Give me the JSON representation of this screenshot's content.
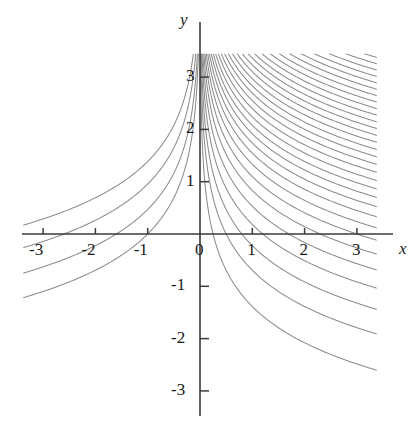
{
  "figure": {
    "type": "contour-plot",
    "background_color": "#ffffff",
    "axis_color": "#3a3a3a",
    "contour_color": "#8c8c8c",
    "text_color": "#1a1a1a"
  },
  "axes": {
    "x_label": "x",
    "y_label": "y",
    "x_ticks": [
      "-3",
      "-2",
      "-1",
      "0",
      "1",
      "2",
      "3"
    ],
    "y_ticks": [
      "3",
      "2",
      "1",
      "-1",
      "-2",
      "-3"
    ],
    "x_tick_values": [
      -3,
      -2,
      -1,
      0,
      1,
      2,
      3
    ],
    "y_tick_values": [
      3,
      2,
      1,
      -1,
      -2,
      -3
    ],
    "xlim": [
      -3.38,
      3.38
    ],
    "ylim": [
      -3.48,
      3.45
    ],
    "origin_px": [
      200,
      234
    ],
    "unit_px": 52.3
  },
  "chart_data": {
    "type": "line",
    "title": "",
    "xlabel": "x",
    "ylabel": "y",
    "xlim": [
      -3.38,
      3.38
    ],
    "ylim": [
      -3.48,
      3.45
    ],
    "grid": false,
    "legend": "none",
    "contour_levels": [
      -4.0,
      -2.6,
      -1.6,
      -1.0,
      0.25,
      0.5,
      0.8,
      1.2,
      1.7,
      2.3,
      3.0,
      3.8,
      4.7,
      5.7,
      6.8,
      8.0,
      9.4,
      11.0,
      12.8,
      14.8,
      17.0,
      19.5,
      22.3,
      25.4,
      28.9,
      32.8,
      37.2,
      42.1,
      47.6,
      53.8,
      60.8,
      68.7,
      77.6,
      87.6,
      98.9,
      111.6,
      125.9,
      142.0,
      160.2,
      180.7,
      203.8,
      229.8,
      259.1,
      292.1
    ],
    "series": [
      {
        "name": "level curves",
        "values": []
      }
    ]
  }
}
